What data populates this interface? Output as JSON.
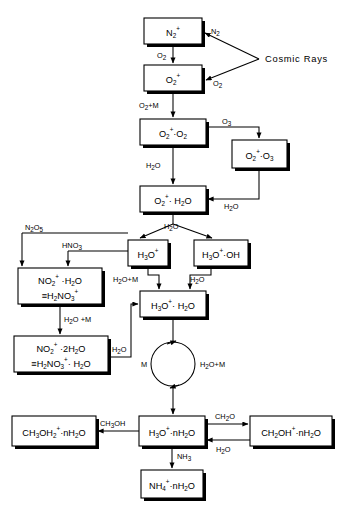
{
  "figure": {
    "type": "flow-diagram",
    "background_color": "#ffffff",
    "line_color": "#000000",
    "source_label": "Cosmic Rays"
  },
  "nodes": [
    {
      "id": "n2p",
      "label": "N2+",
      "x": 144,
      "y": 18,
      "w": 58,
      "h": 26
    },
    {
      "id": "o2p",
      "label": "O2+",
      "x": 144,
      "y": 65,
      "w": 58,
      "h": 26
    },
    {
      "id": "o2p_o2",
      "label": "O2+·O2",
      "x": 140,
      "y": 119,
      "w": 66,
      "h": 26
    },
    {
      "id": "o2p_o3",
      "label": "O2+·O3",
      "x": 232,
      "y": 140,
      "w": 55,
      "h": 28
    },
    {
      "id": "o2p_h2o",
      "label": "O2+·H2O",
      "x": 140,
      "y": 186,
      "w": 66,
      "h": 26
    },
    {
      "id": "h3op",
      "label": "H3O+",
      "x": 128,
      "y": 240,
      "w": 40,
      "h": 26
    },
    {
      "id": "h3op_oh",
      "label": "H3O+·OH",
      "x": 194,
      "y": 240,
      "w": 54,
      "h": 26
    },
    {
      "id": "no2p_h2o",
      "label": "NO2+·H2O ≡H2NO3+",
      "x": 18,
      "y": 268,
      "w": 84,
      "h": 36
    },
    {
      "id": "no2p_2h2o",
      "label": "NO2+·2H2O ≡H2NO3+·H2O",
      "x": 14,
      "y": 336,
      "w": 94,
      "h": 36
    },
    {
      "id": "h3op_h2o",
      "label": "H3O+·H2O",
      "x": 140,
      "y": 291,
      "w": 66,
      "h": 26
    },
    {
      "id": "h3op_nh2o",
      "label": "H3O+·nH2O",
      "x": 139,
      "y": 416,
      "w": 66,
      "h": 30
    },
    {
      "id": "ch3oh2",
      "label": "CH3OH2+·nH2O",
      "x": 12,
      "y": 416,
      "w": 84,
      "h": 30
    },
    {
      "id": "ch2oh",
      "label": "CH2OH+·nH2O",
      "x": 250,
      "y": 416,
      "w": 82,
      "h": 30
    },
    {
      "id": "nh4",
      "label": "NH4+·nH2O",
      "x": 141,
      "y": 470,
      "w": 62,
      "h": 28
    }
  ],
  "edge_labels": {
    "n2_feed": "N2",
    "o2_feed": "O2",
    "n2_to_o2": "O2",
    "o2_to_o2o2": "O2+M",
    "o2o2_to_o2o3": "O3",
    "o2o2_to_o2h2o": "H2O",
    "o2o3_to_o2h2o": "H2O",
    "o2h2o_split": "H2O",
    "h3op_to_h3oph2o": "H2O+M",
    "h3opoh_to_h3oph2o": "H2O",
    "n2o5_feed": "N2O5",
    "hno3_feed": "HNO3",
    "no2_to_no2_2": "H2O+M",
    "no2_2_to_h3oph2o": "H2O",
    "loop_left": "M",
    "loop_right": "H2O+M",
    "ch3oh_branch": "CH3OH",
    "ch2o_branch": "CH2O",
    "h2o_back": "H2O",
    "nh3_branch": "NH3"
  }
}
